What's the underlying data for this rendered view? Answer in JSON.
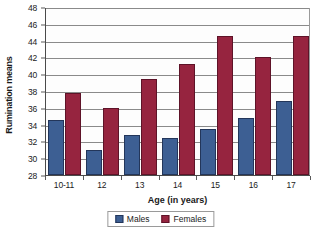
{
  "chart_data": {
    "type": "bar",
    "title": "",
    "xlabel": "Age (in years)",
    "ylabel": "Rumination means",
    "categories": [
      "10-11",
      "12",
      "13",
      "14",
      "15",
      "16",
      "17"
    ],
    "series": [
      {
        "name": "Males",
        "color": "#3d5f93",
        "values": [
          34.5,
          31.0,
          32.8,
          32.4,
          33.5,
          34.8,
          36.8
        ]
      },
      {
        "name": "Females",
        "color": "#96243f",
        "values": [
          37.8,
          36.0,
          39.4,
          41.2,
          44.5,
          42.0,
          44.5
        ]
      }
    ],
    "ylim": [
      28,
      48
    ],
    "ytick_step": 2,
    "yticks": [
      48,
      46,
      44,
      42,
      40,
      38,
      36,
      34,
      32,
      30,
      28
    ],
    "grid": true,
    "legend_position": "bottom"
  },
  "legend": {
    "items": [
      {
        "label": "Males"
      },
      {
        "label": "Females"
      }
    ]
  }
}
